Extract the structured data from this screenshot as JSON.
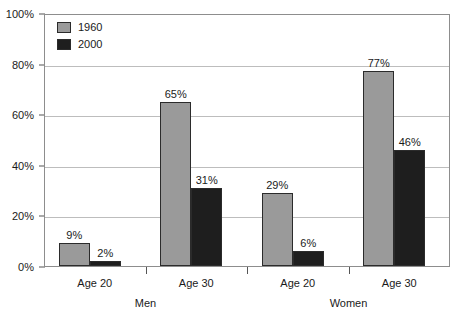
{
  "chart_data": {
    "type": "bar",
    "title": "",
    "subtitle": "",
    "xlabel": "",
    "ylabel": "",
    "ylim": [
      0,
      100
    ],
    "ytick_labels": [
      "0%",
      "20%",
      "40%",
      "60%",
      "80%",
      "100%"
    ],
    "ytick_values": [
      0,
      20,
      40,
      60,
      80,
      100
    ],
    "grid": true,
    "legend_position": "top-left",
    "categories": [
      "Age 20",
      "Age 30",
      "Age 20",
      "Age 30"
    ],
    "group_labels": [
      "Men",
      "Women"
    ],
    "series": [
      {
        "name": "1960",
        "color": "#9a9a9a",
        "values": [
          9,
          65,
          29,
          77
        ],
        "value_labels": [
          "9%",
          "65%",
          "29%",
          "77%"
        ]
      },
      {
        "name": "2000",
        "color": "#1e1e1e",
        "values": [
          2,
          31,
          6,
          46
        ],
        "value_labels": [
          "2%",
          "31%",
          "6%",
          "46%"
        ]
      }
    ]
  },
  "legend": {
    "items": [
      {
        "label": "1960",
        "swatch_color": "#9a9a9a"
      },
      {
        "label": "2000",
        "swatch_color": "#1e1e1e"
      }
    ]
  },
  "axes": {
    "y_ticks": [
      "0%",
      "20%",
      "40%",
      "60%",
      "80%",
      "100%"
    ],
    "x_categories": [
      "Age 20",
      "Age 30",
      "Age 20",
      "Age 30"
    ],
    "x_groups": [
      "Men",
      "Women"
    ]
  }
}
